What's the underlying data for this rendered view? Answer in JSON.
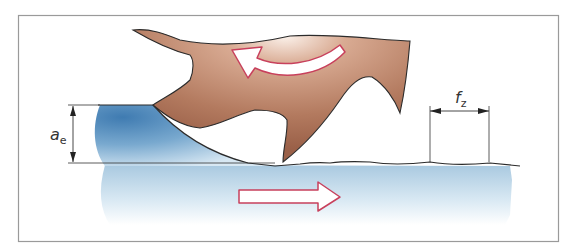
{
  "diagram": {
    "labels": {
      "depth_of_cut": {
        "symbol": "a",
        "subscript": "e"
      },
      "feed_per_tooth": {
        "symbol": "f",
        "subscript": "z"
      }
    },
    "elements": {
      "cutter": "milling-cutter-tooth",
      "chip": "chip",
      "workpiece": "workpiece",
      "rotation_arrow": "curved-arrow-counterclockwise",
      "feed_arrow": "straight-arrow-right"
    },
    "colors": {
      "frame": "#9a9a9a",
      "cutter": "#a86f55",
      "cutter_light": "#e8c7b6",
      "cutter_outline": "#2b2b2b",
      "workpiece_dark": "#4d86b8",
      "workpiece_light": "#cfe3f0",
      "arrow_outline": "#c8405c",
      "arrow_fill": "#ffffff",
      "dimension_line": "#333333"
    }
  }
}
